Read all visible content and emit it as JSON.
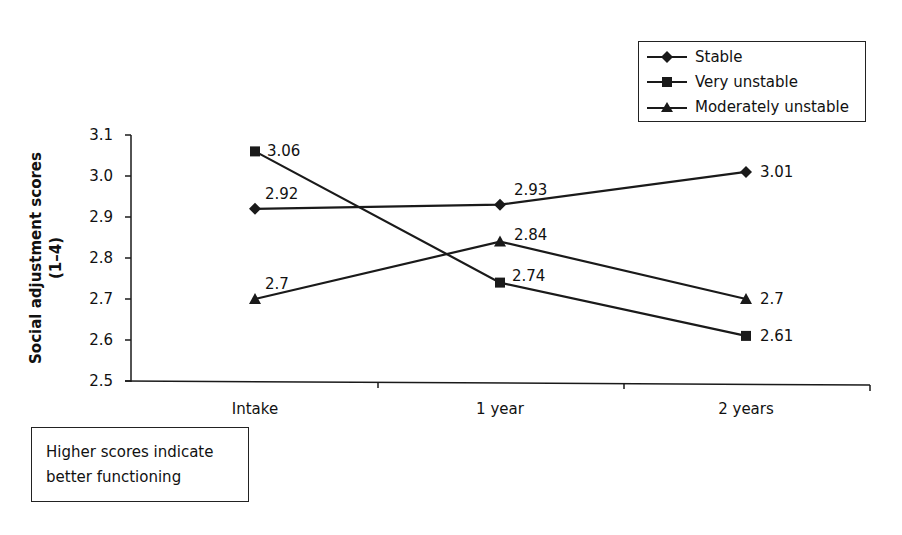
{
  "chart_data": {
    "type": "line",
    "title": "",
    "xlabel": "",
    "ylabel": "Social adjustment scores (1–4)",
    "categories": [
      "Intake",
      "1 year",
      "2 years"
    ],
    "series": [
      {
        "name": "Stable",
        "marker": "diamond",
        "values": [
          2.92,
          2.93,
          3.01
        ]
      },
      {
        "name": "Very unstable",
        "marker": "square",
        "values": [
          3.06,
          2.74,
          2.61
        ]
      },
      {
        "name": "Moderately unstable",
        "marker": "triangle",
        "values": [
          2.7,
          2.84,
          2.7
        ]
      }
    ],
    "data_labels": {
      "Stable": [
        "2.92",
        "2.93",
        "3.01"
      ],
      "Very unstable": [
        "3.06",
        "2.74",
        "2.61"
      ],
      "Moderately unstable": [
        "2.7",
        "2.84",
        "2.7"
      ]
    },
    "ylim": [
      2.5,
      3.1
    ],
    "yticks": [
      "2.5",
      "2.6",
      "2.7",
      "2.8",
      "2.9",
      "3.0",
      "3.1"
    ],
    "grid": false,
    "legend_position": "top-right",
    "annotation": "Higher scores indicate better functioning"
  },
  "legend": {
    "items": [
      {
        "label": "Stable"
      },
      {
        "label": "Very unstable"
      },
      {
        "label": "Moderately unstable"
      }
    ]
  },
  "axis": {
    "ylabel_line1": "Social adjustment scores",
    "ylabel_line2": "(1–4)"
  },
  "note": {
    "line1": "Higher scores indicate",
    "line2": "better functioning"
  },
  "colors": {
    "line": "#1a1a1a",
    "background": "#ffffff"
  }
}
